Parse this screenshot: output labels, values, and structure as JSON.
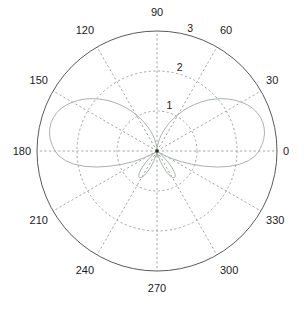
{
  "figure": {
    "kind": "polar-plot",
    "background_color": "#ffffff",
    "width": 307,
    "height": 312
  },
  "axes": {
    "center_x": 157,
    "center_y": 151,
    "outer_radius": 120,
    "outline_color": "#5a5a5a",
    "grid_color": "#9a9a9a",
    "label_color": "#1a1a1a"
  },
  "chart_data": {
    "type": "line",
    "subtype": "polar",
    "title": "",
    "xlabel": "",
    "ylabel": "",
    "grid": true,
    "legend": null,
    "theta_unit": "degrees",
    "theta_direction": "counterclockwise",
    "theta_zero_location": "E",
    "rlim": [
      0,
      3
    ],
    "r_ticks": [
      1,
      2,
      3
    ],
    "r_tick_labels": [
      "1",
      "2",
      "3"
    ],
    "theta_ticks": [
      0,
      30,
      60,
      90,
      120,
      150,
      180,
      210,
      240,
      270,
      300,
      330
    ],
    "theta_tick_labels": [
      "0",
      "30",
      "60",
      "90",
      "120",
      "150",
      "180",
      "210",
      "240",
      "270",
      "300",
      "330"
    ],
    "series": [
      {
        "name": "radiation-pattern",
        "color": "#a8b4a8",
        "line_width": 1,
        "line_style": "solid",
        "theta": [
          0,
          3,
          6,
          9,
          12,
          15,
          18,
          21,
          24,
          27,
          30,
          33,
          36,
          39,
          42,
          45,
          48,
          51,
          54,
          57,
          60,
          63,
          66,
          69,
          72,
          75,
          78,
          81,
          84,
          87,
          90,
          93,
          96,
          99,
          102,
          105,
          108,
          111,
          114,
          117,
          120,
          123,
          126,
          129,
          132,
          135,
          138,
          141,
          144,
          147,
          150,
          153,
          156,
          159,
          162,
          165,
          168,
          171,
          174,
          177,
          180,
          183,
          186,
          189,
          192,
          195,
          198,
          201,
          204,
          207,
          210,
          213,
          216,
          219,
          222,
          225,
          228,
          231,
          234,
          237,
          240,
          243,
          246,
          249,
          252,
          255,
          258,
          261,
          264,
          267,
          270,
          273,
          276,
          279,
          282,
          285,
          288,
          291,
          294,
          297,
          300,
          303,
          306,
          309,
          312,
          315,
          318,
          321,
          324,
          327,
          330,
          333,
          336,
          339,
          342,
          345,
          348,
          351,
          354,
          357,
          360
        ],
        "r": [
          2.55,
          2.62,
          2.68,
          2.72,
          2.74,
          2.74,
          2.72,
          2.68,
          2.62,
          2.54,
          2.44,
          2.33,
          2.21,
          2.08,
          1.94,
          1.8,
          1.65,
          1.5,
          1.35,
          1.2,
          1.05,
          0.91,
          0.78,
          0.65,
          0.53,
          0.42,
          0.32,
          0.23,
          0.15,
          0.08,
          0.03,
          0.08,
          0.15,
          0.23,
          0.32,
          0.42,
          0.53,
          0.65,
          0.78,
          0.91,
          1.05,
          1.2,
          1.35,
          1.5,
          1.65,
          1.8,
          1.94,
          2.08,
          2.21,
          2.33,
          2.44,
          2.54,
          2.62,
          2.68,
          2.72,
          2.74,
          2.74,
          2.72,
          2.68,
          2.62,
          2.55,
          2.45,
          2.3,
          2.1,
          1.85,
          1.55,
          1.22,
          0.92,
          0.65,
          0.42,
          0.25,
          0.12,
          0.05,
          0.08,
          0.2,
          0.38,
          0.56,
          0.7,
          0.78,
          0.8,
          0.76,
          0.67,
          0.55,
          0.41,
          0.27,
          0.15,
          0.07,
          0.03,
          0.05,
          0.1,
          0.14,
          0.1,
          0.05,
          0.03,
          0.07,
          0.15,
          0.27,
          0.41,
          0.55,
          0.67,
          0.76,
          0.8,
          0.78,
          0.7,
          0.56,
          0.38,
          0.2,
          0.08,
          0.05,
          0.12,
          0.25,
          0.42,
          0.65,
          0.92,
          1.22,
          1.55,
          1.85,
          2.1,
          2.3,
          2.45,
          2.55
        ]
      }
    ],
    "annotations": []
  },
  "angular_labels": [
    {
      "text": "0",
      "deg": 0
    },
    {
      "text": "30",
      "deg": 30
    },
    {
      "text": "60",
      "deg": 60
    },
    {
      "text": "90",
      "deg": 90
    },
    {
      "text": "120",
      "deg": 120
    },
    {
      "text": "150",
      "deg": 150
    },
    {
      "text": "180",
      "deg": 180
    },
    {
      "text": "210",
      "deg": 210
    },
    {
      "text": "240",
      "deg": 240
    },
    {
      "text": "270",
      "deg": 270
    },
    {
      "text": "300",
      "deg": 300
    },
    {
      "text": "330",
      "deg": 330
    }
  ],
  "radial_labels": [
    {
      "text": "1",
      "r": 1
    },
    {
      "text": "2",
      "r": 2
    },
    {
      "text": "3",
      "r": 3
    }
  ]
}
